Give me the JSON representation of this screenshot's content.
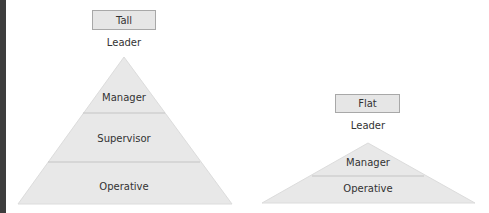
{
  "tall": {
    "title": "Tall",
    "top_label": "Leader",
    "layers": [
      "Manager",
      "Supervisor",
      "Operative"
    ]
  },
  "flat": {
    "title": "Flat",
    "top_label": "Leader",
    "layers": [
      "Manager",
      "Operative"
    ]
  },
  "colors": {
    "fill": "#e8e8e8",
    "divider": "#c4c4c4",
    "box_fill": "#e6e6e6",
    "box_border": "#a8a8a8"
  }
}
